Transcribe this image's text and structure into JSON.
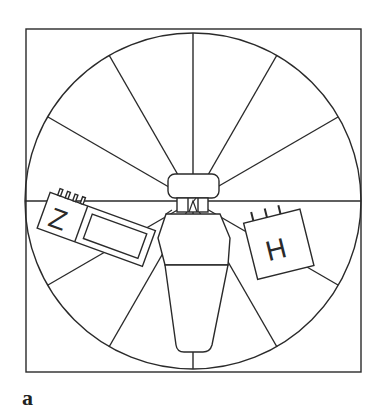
{
  "figure": {
    "panel_label": "a",
    "stroke_color": "#2a2a2a",
    "background": "#ffffff",
    "frame": {
      "x": 26,
      "y": 29,
      "w": 335,
      "h": 343
    },
    "circle": {
      "cx": 193,
      "cy": 201,
      "r": 168
    },
    "spokes_count": 12,
    "modules": {
      "left": {
        "letter": "Z",
        "pins": 4
      },
      "right": {
        "letter": "H",
        "pins": 3
      }
    }
  }
}
